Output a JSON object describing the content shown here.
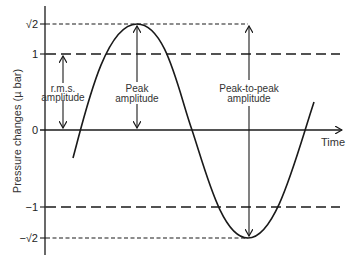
{
  "diagram": {
    "type": "sine-wave-amplitude-diagram",
    "y_axis": {
      "title": "Pressure changes (µ bar)",
      "ticks": [
        {
          "label": "√2",
          "value": 1.414
        },
        {
          "label": "1",
          "value": 1
        },
        {
          "label": "0",
          "value": 0
        },
        {
          "label": "−1",
          "value": -1
        },
        {
          "label": "−√2",
          "value": -1.414
        }
      ]
    },
    "x_axis": {
      "title": "Time"
    },
    "reference_lines": [
      {
        "level": "√2",
        "style": "short-dash"
      },
      {
        "level": "1",
        "style": "long-dash"
      },
      {
        "level": "−1",
        "style": "long-dash"
      },
      {
        "level": "−√2",
        "style": "short-dash"
      }
    ],
    "annotations": {
      "rms": {
        "line1": "r.m.s.",
        "line2": "amplitude"
      },
      "peak": {
        "line1": "Peak",
        "line2": "amplitude"
      },
      "peak_to_peak": {
        "line1": "Peak-to-peak",
        "line2": "amplitude"
      }
    },
    "colors": {
      "ink": "#1a1a1a",
      "background": "#ffffff"
    }
  }
}
